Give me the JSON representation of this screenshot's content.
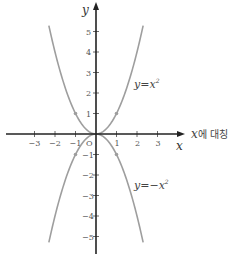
{
  "chart_data": {
    "type": "line",
    "title": "",
    "xlabel": "x",
    "ylabel": "y",
    "xlim": [
      -3.5,
      4.2
    ],
    "ylim": [
      -5.8,
      5.4
    ],
    "x_ticks": [
      -3,
      -2,
      -1,
      1,
      2,
      3
    ],
    "y_ticks": [
      5,
      4,
      3,
      2,
      1,
      -1,
      -2,
      -3,
      -4,
      -5
    ],
    "origin_label": "O",
    "grid": false,
    "series": [
      {
        "name": "y=x²",
        "formula": "x^2",
        "label": "y=x",
        "label_sup": "2",
        "color": "#9e9e9e",
        "marked_points": [
          [
            -1,
            1
          ],
          [
            1,
            1
          ]
        ]
      },
      {
        "name": "y=-x²",
        "formula": "-x^2",
        "label": "y=−x",
        "label_sup": "2",
        "color": "#9e9e9e",
        "marked_points": [
          [
            -1,
            -1
          ],
          [
            1,
            -1
          ]
        ]
      }
    ],
    "annotation": "x에 대칭"
  },
  "layout": {
    "origin_px": [
      96,
      134
    ],
    "unit_px": 20.5,
    "axis_color": "#222222",
    "curve_color": "#a0a0a0"
  }
}
